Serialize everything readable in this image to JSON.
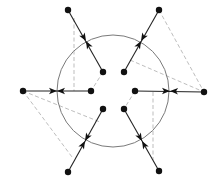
{
  "diagram": {
    "width": 217,
    "height": 186,
    "colors": {
      "background": "#ffffff",
      "circle": "#7a7a7a",
      "edge": "#222222",
      "dashed": "#b5b5b5",
      "node": "#111111"
    },
    "circle": {
      "cx": 113,
      "cy": 91,
      "r": 56
    },
    "outer_nodes": [
      {
        "id": "o-top-left",
        "x": 68,
        "y": 10
      },
      {
        "id": "o-top-right",
        "x": 159,
        "y": 10
      },
      {
        "id": "o-left",
        "x": 23,
        "y": 91
      },
      {
        "id": "o-right",
        "x": 204,
        "y": 92
      },
      {
        "id": "o-bottom-left",
        "x": 68,
        "y": 172
      },
      {
        "id": "o-bottom-right",
        "x": 159,
        "y": 171
      }
    ],
    "inner_nodes": [
      {
        "id": "i-top-left",
        "x": 103,
        "y": 72
      },
      {
        "id": "i-top-right",
        "x": 124,
        "y": 72
      },
      {
        "id": "i-left",
        "x": 91,
        "y": 91
      },
      {
        "id": "i-right",
        "x": 135,
        "y": 91
      },
      {
        "id": "i-bottom-left",
        "x": 103,
        "y": 109
      },
      {
        "id": "i-bottom-right",
        "x": 124,
        "y": 109
      }
    ],
    "edges": [
      {
        "from": [
          68,
          10
        ],
        "to": [
          103,
          72
        ],
        "meet": [
          86,
          41
        ]
      },
      {
        "from": [
          159,
          10
        ],
        "to": [
          124,
          72
        ],
        "meet": [
          141,
          41
        ]
      },
      {
        "from": [
          23,
          91
        ],
        "to": [
          91,
          91
        ],
        "meet": [
          57,
          91
        ]
      },
      {
        "from": [
          204,
          92
        ],
        "to": [
          135,
          91
        ],
        "meet": [
          170,
          91
        ]
      },
      {
        "from": [
          68,
          172
        ],
        "to": [
          103,
          109
        ],
        "meet": [
          85,
          141
        ]
      },
      {
        "from": [
          159,
          171
        ],
        "to": [
          124,
          109
        ],
        "meet": [
          142,
          141
        ]
      }
    ],
    "dashed_lines": [
      {
        "x1": 74,
        "y1": 18,
        "x2": 74,
        "y2": 91
      },
      {
        "x1": 103,
        "y1": 72,
        "x2": 91,
        "y2": 91
      },
      {
        "x1": 153,
        "y1": 92,
        "x2": 153,
        "y2": 160
      },
      {
        "x1": 135,
        "y1": 91,
        "x2": 124,
        "y2": 109
      },
      {
        "x1": 159,
        "y1": 10,
        "x2": 204,
        "y2": 92
      },
      {
        "x1": 130,
        "y1": 60,
        "x2": 204,
        "y2": 92
      },
      {
        "x1": 23,
        "y1": 91,
        "x2": 100,
        "y2": 122
      },
      {
        "x1": 23,
        "y1": 91,
        "x2": 72,
        "y2": 157
      }
    ]
  }
}
